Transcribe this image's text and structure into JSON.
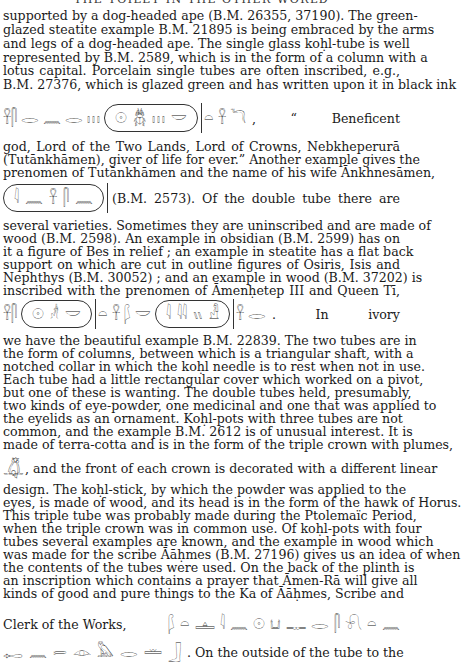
{
  "running_head": "THE TOILET IN THE OTHER WORLD",
  "paragraph_1": {
    "lines": [
      "supported by a dog-headed ape (B.M. 26355, 37190).  The green-",
      "glazed steatite example B.M. 21895 is being embraced by the arms",
      "and legs of a dog-headed ape.  The single glass koḥl-tube is well",
      "represented by B.M. 2589, which is in the form of a column with a",
      "lotus capital.  Porcelain single tubes are often inscribed, e.g.,",
      "B.M. 27376, which is glazed green and has written upon it in black ink"
    ]
  },
  "hieroglyph_line_1": {
    "glyphs_before": [
      "𓋹𓋴",
      "𓂋",
      "𓈖",
      "𓂋",
      "𓏥"
    ],
    "cartouche": [
      "𓇳",
      "𓆣",
      "𓏥",
      "𓎟"
    ],
    "glyphs_after": [
      "𓏏",
      "𓋹",
      "𓆓"
    ],
    "text": ", “ Beneficent"
  },
  "paragraph_2": {
    "lines": [
      "god, Lord of the Two Lands, Lord of Crowns, Nebkheperurā",
      "(Tutānkhāmen), giver of life for ever.”  Another example gives the",
      "prenomen of Tutānkhāmen and the name of his wife Ānkhnesāmen,"
    ]
  },
  "hieroglyph_line_2": {
    "cartouche": [
      "𓇋",
      "𓈖",
      "𓋹",
      "𓋴",
      "𓈖"
    ],
    "text": "(B.M. 2573).  Of the double tube there are"
  },
  "paragraph_3": {
    "lines": [
      "several varieties.  Sometimes they are uninscribed and are made of",
      "wood (B.M. 2598).  An example in obsidian (B.M. 2599) has on",
      "it a figure of Bes in relief ; an example in steatite has a flat back",
      "support on which are cut in outline figures of Osiris, Isis and",
      "Nephthys (B.M. 30052) ; and an example in wood (B.M. 37202) is",
      "inscribed with the prenomen of Āmenḥetep III and Queen Tī,"
    ]
  },
  "hieroglyph_line_3": {
    "glyphs_before": [
      "𓋹𓋴"
    ],
    "cartouche_1": [
      "𓇳",
      "𓁦",
      "𓎟"
    ],
    "glyphs_middle": [
      "𓏏",
      "𓋹",
      "𓆄",
      "𓎟"
    ],
    "cartouche_2": [
      "𓇋",
      "𓇋𓇋",
      "𓏭",
      "𓁐"
    ],
    "glyphs_after": [
      "𓋹",
      "𓂋"
    ],
    "text": ".  In ivory"
  },
  "paragraph_4": {
    "lines": [
      "we have the beautiful example B.M. 22839.  The two tubes are in",
      "the form of columns, between which is a triangular shaft, with a",
      "notched collar in which the koḥl needle is to rest when not in use.",
      "Each tube had a little rectangular cover which worked on a pivot,",
      "but one of these is wanting.  The double tubes held, presumably,",
      "two kinds of eye-powder, one medicinal and one that was applied to",
      "the eyelids as an ornament.  Koḥl-pots with three tubes are not",
      "common, and the example B.M. 2612 is of unusual interest.  It is",
      "made of terra-cotta and is in the form of the triple crown with plumes,"
    ]
  },
  "crown_line": {
    "glyph": "𓋚",
    "text": ", and the front of each crown is decorated with a different linear"
  },
  "paragraph_5": {
    "lines": [
      "design.  The koḥl-stick, by which the powder was applied to the",
      "eyes, is made of wood, and its head is in the form of the hawk of Horus.",
      "This triple tube was probably made during the Ptolemaïc Period,",
      "when the triple crown was in common use.  Of koḥl-pots with four",
      "tubes several examples are known, and the example in wood which",
      "was made for the scribe Āāḥmes (B.M. 27196) gives us an idea of when",
      "the contents of the tubes were used.  On the back of the plinth is",
      "an inscription which contains a prayer that Āmen-Rā will give all",
      "kinds of good and pure things to the Ka of Āāḥmes, Scribe and"
    ]
  },
  "clerk_line": {
    "text": "Clerk of the Works,",
    "glyphs": [
      "𓆄",
      "𓏏",
      "𓊵",
      "𓇋",
      "𓈖",
      "𓇳",
      "𓂓",
      "𓊃",
      "𓂋",
      "𓋴",
      "𓍯",
      "𓏏",
      "𓈖"
    ]
  },
  "final_line": {
    "glyphs": [
      "𓉻",
      "𓈖",
      "𓍿",
      "𓁹",
      "𓅓",
      "𓂋",
      "𓏛",
      "𓃀"
    ],
    "text": ".  On the outside of the tube to the"
  }
}
